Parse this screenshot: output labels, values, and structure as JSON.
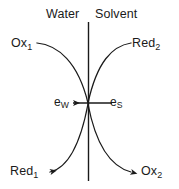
{
  "diagram": {
    "colors": {
      "stroke": "#1a1a1a",
      "text": "#1a1a1a",
      "background": "#ffffff"
    },
    "interface_line": {
      "name": "interface",
      "x": 88,
      "y_top": 22,
      "y_bottom": 181
    },
    "phases": {
      "left": "Water",
      "right": "Solvent"
    },
    "species": {
      "top_left": {
        "text": "Ox",
        "sub": "1"
      },
      "top_right": {
        "text": "Red",
        "sub": "2"
      },
      "bottom_left": {
        "text": "Red",
        "sub": "1"
      },
      "bottom_right": {
        "text": "Ox",
        "sub": "2"
      }
    },
    "electrons": {
      "left": {
        "text": "e",
        "sub": "W"
      },
      "right": {
        "text": "e",
        "sub": "S"
      }
    },
    "arrows": [
      {
        "name": "electron-transfer-arrow",
        "direction": "left",
        "from_x": 112,
        "to_x": 71,
        "y": 103
      },
      {
        "name": "red1-arrow",
        "direction": "left"
      },
      {
        "name": "ox2-arrow",
        "direction": "right"
      }
    ],
    "curves": [
      {
        "name": "ox1-to-center",
        "start": [
          37,
          43
        ],
        "end": [
          88,
          103
        ],
        "arrowhead": false
      },
      {
        "name": "center-to-red2",
        "start": [
          88,
          103
        ],
        "end": [
          130,
          43
        ],
        "arrowhead": false
      },
      {
        "name": "center-to-red1",
        "start": [
          88,
          103
        ],
        "end": [
          48,
          172
        ],
        "arrowhead": true
      },
      {
        "name": "center-to-ox2",
        "start": [
          88,
          103
        ],
        "end": [
          133,
          172
        ],
        "arrowhead": true
      }
    ]
  }
}
